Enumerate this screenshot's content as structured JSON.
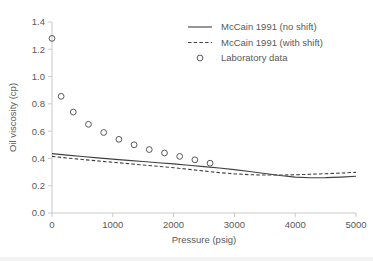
{
  "chart_data": {
    "type": "scatter",
    "title": "",
    "xlabel": "Pressure (psig)",
    "ylabel": "Oil viscosity (cp)",
    "xlim": [
      0,
      5000
    ],
    "ylim": [
      0.0,
      1.4
    ],
    "xticks": [
      0,
      1000,
      2000,
      3000,
      4000,
      5000
    ],
    "xtick_labels": [
      "0",
      "1000",
      "2000",
      "3000",
      "4000",
      "5000"
    ],
    "yticks": [
      0.0,
      0.2,
      0.4,
      0.6,
      0.8,
      1.0,
      1.2,
      1.4
    ],
    "ytick_labels": [
      "0.0",
      "0.2",
      "0.4",
      "0.6",
      "0.8",
      "1.0",
      "1.2",
      "1.4"
    ],
    "grid": false,
    "legend_position": "top-right",
    "series": [
      {
        "name": "McCain 1991 (no shift)",
        "style": "solid-line",
        "color": "#404040",
        "x": [
          0,
          250,
          500,
          750,
          1000,
          1250,
          1500,
          1750,
          2000,
          2250,
          2500,
          2750,
          3000,
          3250,
          3500,
          3750,
          4000,
          4250,
          4500,
          4750,
          5000
        ],
        "y": [
          0.435,
          0.424,
          0.414,
          0.404,
          0.395,
          0.386,
          0.377,
          0.368,
          0.36,
          0.35,
          0.34,
          0.33,
          0.318,
          0.304,
          0.29,
          0.275,
          0.263,
          0.258,
          0.259,
          0.263,
          0.269
        ]
      },
      {
        "name": "McCain 1991 (with shift)",
        "style": "dashed-line",
        "color": "#404040",
        "x": [
          0,
          250,
          500,
          750,
          1000,
          1250,
          1500,
          1750,
          2000,
          2250,
          2500,
          2750,
          3000,
          3250,
          3500,
          3750,
          4000,
          4250,
          4500,
          4750,
          5000
        ],
        "y": [
          0.415,
          0.403,
          0.392,
          0.382,
          0.372,
          0.362,
          0.352,
          0.342,
          0.332,
          0.32,
          0.308,
          0.296,
          0.287,
          0.281,
          0.278,
          0.278,
          0.28,
          0.284,
          0.288,
          0.293,
          0.298
        ]
      },
      {
        "name": "Laboratory data",
        "style": "open-circle-markers",
        "color": "#595959",
        "x": [
          0,
          150,
          350,
          600,
          850,
          1100,
          1350,
          1600,
          1850,
          2100,
          2350,
          2600
        ],
        "y": [
          1.28,
          0.855,
          0.74,
          0.65,
          0.59,
          0.54,
          0.5,
          0.465,
          0.44,
          0.415,
          0.39,
          0.365
        ]
      }
    ]
  },
  "legend": {
    "items": [
      {
        "label": "McCain 1991 (no shift)",
        "marker": "solid-line"
      },
      {
        "label": "McCain 1991 (with shift)",
        "marker": "dashed-line"
      },
      {
        "label": "Laboratory data",
        "marker": "open-circle"
      }
    ]
  }
}
